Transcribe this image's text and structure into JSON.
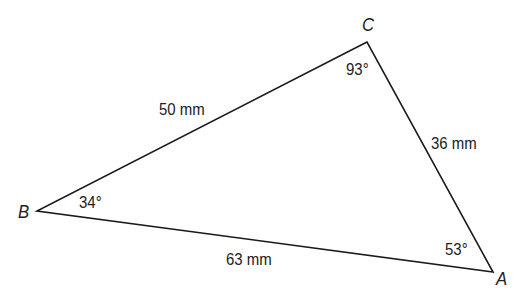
{
  "figure": {
    "type": "triangle",
    "vertices": {
      "A": {
        "label": "A",
        "angle": "53°"
      },
      "B": {
        "label": "B",
        "angle": "34°"
      },
      "C": {
        "label": "C",
        "angle": "93°"
      }
    },
    "sides": {
      "BC": "50 mm",
      "CA": "36 mm",
      "BA": "63 mm"
    },
    "stroke_color": "#1a1a1a"
  }
}
